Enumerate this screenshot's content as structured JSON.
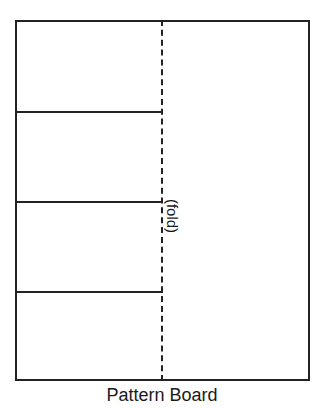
{
  "diagram": {
    "caption": "Pattern Board",
    "fold_label": "(fold)",
    "line_color": "#222222",
    "sections": {
      "left_half_divisions": 4,
      "horizontal_lines_count": 3
    }
  }
}
